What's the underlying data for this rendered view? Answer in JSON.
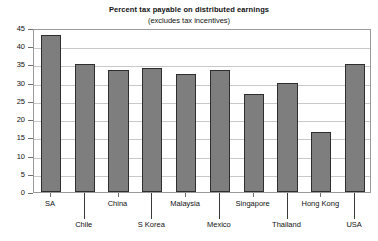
{
  "chart_data": {
    "type": "bar",
    "title": "Percent tax payable on distributed earnings",
    "subtitle": "(excludes tax incentives)",
    "xlabel": "",
    "ylabel": "",
    "ylim": [
      0,
      45
    ],
    "ytick_step": 5,
    "yticks": [
      "45",
      "40",
      "35",
      "30",
      "25",
      "20",
      "15",
      "10",
      "5",
      "0"
    ],
    "grid": true,
    "legend": "none",
    "categories": [
      "SA",
      "Chile",
      "China",
      "S Korea",
      "Malaysia",
      "Mexico",
      "Singapore",
      "Thailand",
      "Hong Kong",
      "USA"
    ],
    "values": [
      43,
      35,
      33.5,
      34,
      32.5,
      33.5,
      27,
      30,
      16.5,
      35
    ],
    "label_rows": [
      1,
      2,
      1,
      2,
      1,
      2,
      1,
      2,
      1,
      2
    ],
    "bar_color": "#7e7e7e",
    "bar_border_color": "#2e2e2e",
    "grid_color": "#c8c8c8",
    "frame_color": "#9a9a9a"
  }
}
